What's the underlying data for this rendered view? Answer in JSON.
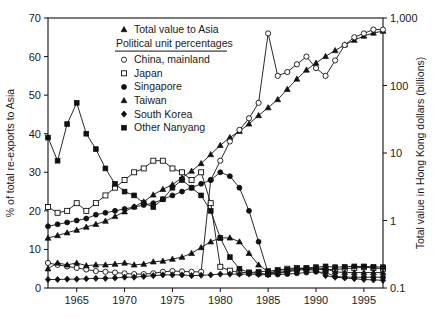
{
  "chart_data": {
    "type": "line",
    "title": "",
    "xlabel": "",
    "ylabel": "% of total re-exports to Asia",
    "y2label": "Total value in Hong Kong dollars (billions)",
    "xlim": [
      1962,
      1997
    ],
    "ylim": [
      0,
      70
    ],
    "y2lim": [
      0.1,
      1000
    ],
    "y2scale": "log",
    "grid": false,
    "legend_position": "top-right",
    "xticks": [
      1965,
      1970,
      1975,
      1980,
      1985,
      1990,
      1995
    ],
    "xtick_labels": [
      "1965",
      "1970",
      "1975",
      "1980",
      "1985",
      "1990",
      "1995"
    ],
    "yticks": [
      0,
      10,
      20,
      30,
      40,
      50,
      60,
      70
    ],
    "ytick_labels": [
      "0",
      "10",
      "20",
      "30",
      "40",
      "50",
      "60",
      "70"
    ],
    "y2ticks": [
      0.1,
      1,
      10,
      100,
      1000
    ],
    "y2tick_labels": [
      "0.1",
      "1",
      "10",
      "100",
      "1,000"
    ],
    "x": [
      1962,
      1963,
      1964,
      1965,
      1966,
      1967,
      1968,
      1969,
      1970,
      1971,
      1972,
      1973,
      1974,
      1975,
      1976,
      1977,
      1978,
      1979,
      1980,
      1981,
      1982,
      1983,
      1984,
      1985,
      1986,
      1987,
      1988,
      1989,
      1990,
      1991,
      1992,
      1993,
      1994,
      1995,
      1996,
      1997
    ],
    "series": [
      {
        "name": "Total value to Asia",
        "marker": "triangle-filled",
        "axis": "right",
        "unit": "HK$ billions (log scale)",
        "values": [
          0.55,
          0.6,
          0.66,
          0.72,
          0.8,
          0.88,
          0.98,
          1.15,
          1.35,
          1.6,
          1.9,
          2.4,
          2.9,
          3.4,
          4.3,
          5.4,
          7.0,
          9.5,
          13,
          17,
          21,
          27,
          36,
          47,
          62,
          88,
          125,
          170,
          215,
          270,
          330,
          400,
          470,
          540,
          600,
          640
        ]
      },
      {
        "name": "China, mainland",
        "marker": "circle-open",
        "axis": "left",
        "unit": "% of total re-exports to Asia",
        "values": [
          6.5,
          6.0,
          5.6,
          5.2,
          4.8,
          4.4,
          4.2,
          4.0,
          3.8,
          3.6,
          3.6,
          3.8,
          4.2,
          4.4,
          4.3,
          4.2,
          4.2,
          28,
          33,
          38,
          41,
          44,
          48,
          66,
          55,
          56,
          58,
          60,
          57,
          55,
          59,
          63,
          65,
          66,
          67,
          67
        ]
      },
      {
        "name": "Japan",
        "marker": "square-open",
        "axis": "left",
        "unit": "% of total re-exports to Asia",
        "values": [
          21,
          19.5,
          20,
          22,
          20,
          22,
          24,
          26,
          28,
          30,
          31,
          33,
          33,
          31,
          30,
          28,
          30,
          22,
          5.5,
          4.5,
          4.0,
          4.0,
          3.8,
          3.6,
          4.6,
          5.0,
          5.2,
          5.0,
          4.8,
          4.8,
          4.8,
          5.0,
          5.2,
          5.4,
          5.2,
          5.0
        ]
      },
      {
        "name": "Singapore",
        "marker": "circle-filled",
        "axis": "left",
        "unit": "% of total re-exports to Asia",
        "values": [
          16,
          16.5,
          17,
          17.5,
          18,
          19,
          19.5,
          20,
          20.5,
          21,
          21.5,
          22,
          23,
          24,
          25,
          26,
          27,
          28,
          30,
          29,
          26,
          20,
          12,
          4.0,
          3.5,
          3.6,
          3.8,
          4.0,
          4.2,
          4.0,
          3.0,
          2.8,
          2.8,
          2.8,
          2.8,
          2.8
        ]
      },
      {
        "name": "Taiwan",
        "marker": "triangle-filled",
        "axis": "left",
        "unit": "% of total re-exports to Asia",
        "values": [
          5.0,
          6.5,
          6.0,
          6.5,
          5.8,
          6.0,
          6.0,
          6.2,
          6.5,
          6.0,
          6.2,
          6.8,
          7.0,
          7.5,
          8.0,
          9.0,
          10.5,
          12,
          13,
          13,
          12,
          9.0,
          6.0,
          4.2,
          4.0,
          4.4,
          4.8,
          5.0,
          5.2,
          5.0,
          4.2,
          4.0,
          4.0,
          4.0,
          4.0,
          4.0
        ]
      },
      {
        "name": "South Korea",
        "marker": "diamond-filled",
        "axis": "left",
        "unit": "% of total re-exports to Asia",
        "values": [
          2.2,
          2.2,
          2.3,
          2.3,
          2.4,
          2.5,
          2.5,
          2.6,
          2.8,
          2.8,
          3.0,
          3.2,
          3.4,
          3.4,
          3.4,
          3.2,
          3.3,
          3.4,
          3.6,
          3.6,
          3.6,
          3.6,
          3.5,
          3.4,
          3.8,
          4.2,
          4.6,
          4.8,
          4.6,
          3.2,
          2.8,
          2.6,
          2.4,
          2.2,
          2.1,
          2.0
        ]
      },
      {
        "name": "Other Nanyang",
        "marker": "square-filled",
        "axis": "left",
        "unit": "% of total re-exports to Asia",
        "values": [
          39,
          33,
          42.5,
          48,
          40,
          36,
          31,
          27,
          25,
          24,
          22,
          21,
          23,
          26,
          28,
          26,
          24,
          20,
          13,
          8.0,
          5.0,
          4.0,
          4.2,
          4.4,
          4.6,
          4.8,
          5.0,
          5.2,
          5.4,
          5.6,
          5.4,
          5.5,
          5.6,
          5.6,
          5.5,
          5.4
        ]
      }
    ]
  },
  "legend": {
    "header_label": "Total value to Asia",
    "subheader_label": "Political unit percentages",
    "items": [
      {
        "label": "China, mainland",
        "marker": "circle-open"
      },
      {
        "label": "Japan",
        "marker": "square-open"
      },
      {
        "label": "Singapore",
        "marker": "circle-filled"
      },
      {
        "label": "Taiwan",
        "marker": "triangle-filled"
      },
      {
        "label": "South Korea",
        "marker": "diamond-filled"
      },
      {
        "label": "Other Nanyang",
        "marker": "square-filled"
      }
    ]
  }
}
